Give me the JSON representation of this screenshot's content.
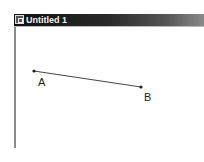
{
  "window": {
    "title": "Untitled 1",
    "icon": "document-icon"
  },
  "sketch": {
    "points": [
      {
        "label": "A",
        "x": 34,
        "y": 71,
        "label_x": 38,
        "label_y": 76
      },
      {
        "label": "B",
        "x": 141,
        "y": 87,
        "label_x": 144,
        "label_y": 91
      }
    ],
    "segment": {
      "from": "A",
      "to": "B",
      "color": "#444444"
    }
  }
}
